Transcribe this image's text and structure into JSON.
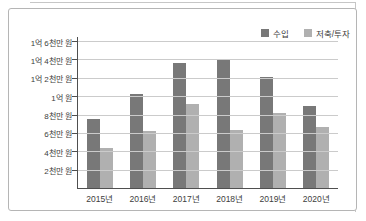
{
  "page": {
    "background": "#ffffff"
  },
  "card": {
    "border_color": "#b5b5b5",
    "background": "#ffffff"
  },
  "legend": {
    "position": "top-right",
    "swatch_icon": "square-swatch-icon"
  },
  "chart_data": {
    "type": "bar",
    "title": "",
    "categories": [
      "2015년",
      "2016년",
      "2017년",
      "2018년",
      "2019년",
      "2020년"
    ],
    "series": [
      {
        "name": "수입",
        "color": "#787878",
        "values": [
          7500,
          10200,
          13600,
          14000,
          12100,
          8900
        ]
      },
      {
        "name": "저축/투자",
        "color": "#b0b0b0",
        "values": [
          4400,
          6200,
          9100,
          6300,
          8200,
          6600
        ]
      }
    ],
    "value_unit": "만 원",
    "ylim": [
      0,
      16000
    ],
    "y_ticks": [
      {
        "value": 16000,
        "label": "1억 6천만 원"
      },
      {
        "value": 14000,
        "label": "1억 4천만 원"
      },
      {
        "value": 12000,
        "label": "1억 2천만 원"
      },
      {
        "value": 10000,
        "label": "1억 원"
      },
      {
        "value": 8000,
        "label": "8천만 원"
      },
      {
        "value": 6000,
        "label": "6천만 원"
      },
      {
        "value": 4000,
        "label": "4천만 원"
      },
      {
        "value": 2000,
        "label": "2천만 원"
      }
    ],
    "grid": true,
    "legend_position": "top-right"
  }
}
